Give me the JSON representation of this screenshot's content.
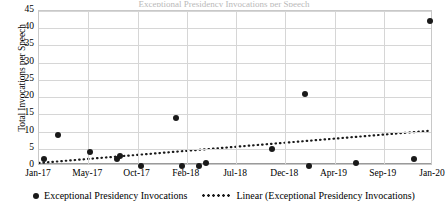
{
  "title_sliver": "Exceptional Presidency Invocations per Speech",
  "chart_data": {
    "type": "scatter",
    "title": "",
    "xlabel": "",
    "ylabel": "Total Invocations per Speech",
    "ylim": [
      0,
      45
    ],
    "yticks": [
      0,
      5,
      10,
      15,
      20,
      25,
      30,
      35,
      40,
      45
    ],
    "xticks": [
      "Jan-17",
      "May-17",
      "Oct-17",
      "Feb-18",
      "Jul-18",
      "Dec-18",
      "Apr-19",
      "Sep-19",
      "Jan-20"
    ],
    "grid": true,
    "legend_position": "bottom",
    "series": [
      {
        "name": "Exceptional Presidency Invocations",
        "type": "scatter",
        "marker": "circle",
        "color": "#1a1a1a",
        "points": [
          {
            "x": "Jan-17",
            "x_frac": 0.013,
            "y": 2
          },
          {
            "x": "Mar-17",
            "x_frac": 0.049,
            "y": 9
          },
          {
            "x": "Jun-17",
            "x_frac": 0.129,
            "y": 4
          },
          {
            "x": "Aug-17",
            "x_frac": 0.198,
            "y": 2
          },
          {
            "x": "Aug-17",
            "x_frac": 0.206,
            "y": 3
          },
          {
            "x": "Oct-17",
            "x_frac": 0.26,
            "y": 0
          },
          {
            "x": "Jan-18",
            "x_frac": 0.347,
            "y": 14
          },
          {
            "x": "Mar-18",
            "x_frac": 0.362,
            "y": 0
          },
          {
            "x": "May-18",
            "x_frac": 0.407,
            "y": 0
          },
          {
            "x": "Jun-18",
            "x_frac": 0.425,
            "y": 1
          },
          {
            "x": "Nov-18",
            "x_frac": 0.592,
            "y": 5
          },
          {
            "x": "Jan-19",
            "x_frac": 0.675,
            "y": 21
          },
          {
            "x": "Jan-19",
            "x_frac": 0.685,
            "y": 0
          },
          {
            "x": "Apr-19",
            "x_frac": 0.805,
            "y": 1
          },
          {
            "x": "Dec-19",
            "x_frac": 0.952,
            "y": 2
          },
          {
            "x": "Jan-20",
            "x_frac": 0.992,
            "y": 42
          }
        ]
      },
      {
        "name": "Linear (Exceptional Presidency Invocations)",
        "type": "line",
        "style": "dotted",
        "color": "#1a1a1a",
        "endpoints": [
          {
            "x_frac": 0.0,
            "y": 0.3
          },
          {
            "x_frac": 1.0,
            "y": 9.8
          }
        ]
      }
    ]
  },
  "legend": {
    "items": [
      {
        "label": "Exceptional Presidency Invocations",
        "marker": "circle"
      },
      {
        "label": "Linear (Exceptional Presidency Invocations)",
        "marker": "dotted-line"
      }
    ]
  }
}
